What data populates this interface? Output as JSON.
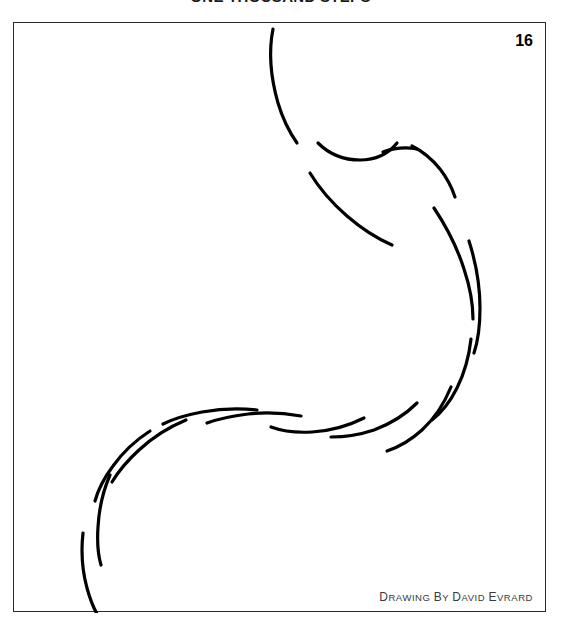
{
  "cartoon": {
    "title": "ONE THOUSAND STEPS",
    "page_number": "16",
    "credit": {
      "full_text": "DRAWING BY DAVID EVRARD",
      "word_1_cap": "D",
      "word_1_rest": "RAWING",
      "word_2_cap": "B",
      "word_2_rest": "Y",
      "word_3_cap": "D",
      "word_3_rest": "AVID",
      "word_4_cap": "E",
      "word_4_rest": "VRARD"
    },
    "colors": {
      "ink": "#000000",
      "frame": "#2b2b2b",
      "paper": "#ffffff",
      "credit_text": "#3a3a3a"
    },
    "artwork": {
      "description": "Large S-shaped curve rendered as two parallel offset dashed strokes sweeping from upper-centre down to lower-left",
      "stroke_width": 3.2,
      "stroke_cap": "round",
      "strokes": [
        "M 259,6 C 255,26 256,52 264,80 C 269,97 276,110 283,120",
        "M 296,150 C 305,165 318,180 333,193 C 348,206 364,216 378,222",
        "M 304,120 C 314,130 329,137 346,137 C 362,137 375,130 383,120",
        "M 398,123 C 408,128 418,136 426,146 C 433,155 438,165 441,174",
        "M 369,129 C 380,125 392,124 403,126",
        "M 420,185 C 432,203 443,224 450,246 C 456,264 459,281 459,296",
        "M 455,218 C 462,240 466,263 466,285 C 466,303 464,318 460,330",
        "M 457,316 C 455,334 450,351 443,365 C 436,379 427,390 418,397",
        "M 437,364 C 430,381 420,396 408,407 C 397,417 385,424 373,428",
        "M 403,380 C 391,392 376,401 360,407 C 345,412 330,414 317,414",
        "M 350,395 C 334,403 316,408 298,409 C 282,410 268,408 257,404",
        "M 287,393 C 270,390 252,389 234,391 C 218,393 204,396 193,400",
        "M 243,387 C 224,385 205,386 188,389 C 172,392 159,396 149,401",
        "M 172,397 C 155,404 139,414 125,427 C 113,438 104,449 98,459",
        "M 136,408 C 122,417 109,429 99,443 C 90,455 84,467 81,478",
        "M 96,452 C 89,468 85,486 84,504 C 83,519 84,532 87,542",
        "M 69,510 C 67,528 68,547 73,565 C 77,580 83,592 88,599"
      ]
    }
  }
}
